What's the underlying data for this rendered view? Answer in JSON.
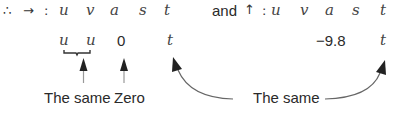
{
  "horizontal": {
    "prefix_therefore": "∴",
    "direction_arrow": "→",
    "colon": ":",
    "headers": [
      "u",
      "v",
      "a",
      "s",
      "t"
    ],
    "values": [
      "u",
      "u",
      "0",
      "t"
    ]
  },
  "vertical": {
    "conjunction": "and",
    "direction_arrow": "↑",
    "colon": ":",
    "headers": [
      "u",
      "v",
      "a",
      "s",
      "t"
    ],
    "values": [
      "−9.8",
      "t"
    ]
  },
  "annotations": {
    "uv_same": "The same",
    "a_zero": "Zero",
    "t_same": "The same"
  },
  "colors": {
    "text": "#2a2a2a",
    "arrow": "#333333",
    "curve": "#555555"
  }
}
